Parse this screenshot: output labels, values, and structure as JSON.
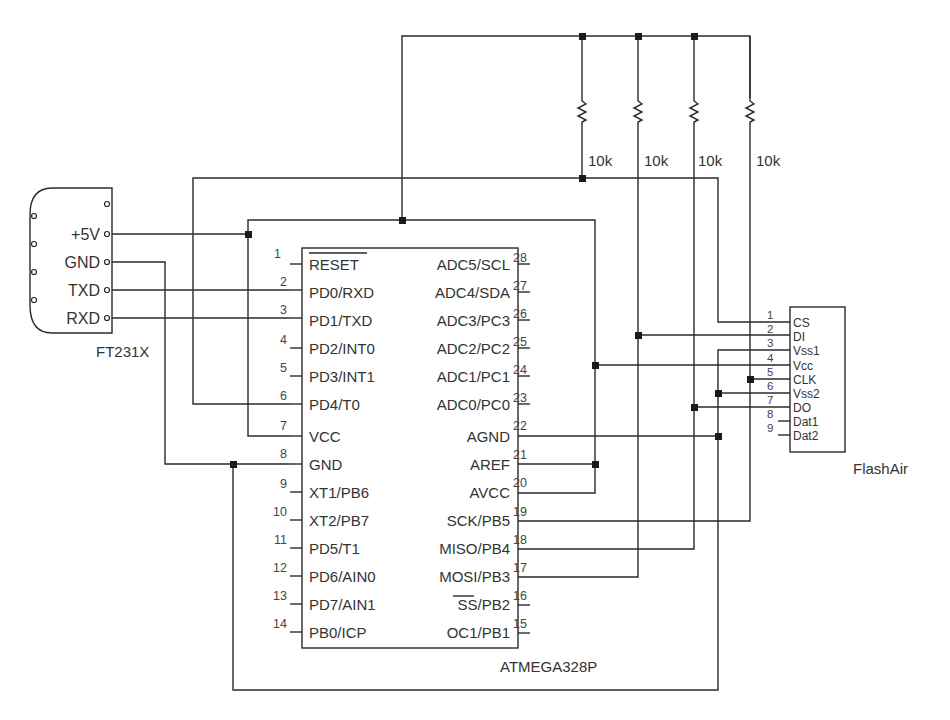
{
  "diagram": {
    "type": "circuit-schematic",
    "resistors": [
      {
        "value": "10k"
      },
      {
        "value": "10k"
      },
      {
        "value": "10k"
      },
      {
        "value": "10k"
      }
    ],
    "ft231x": {
      "name": "FT231X",
      "pins": [
        "+5V",
        "GND",
        "TXD",
        "RXD"
      ]
    },
    "atmega": {
      "name": "ATMEGA328P",
      "left_pins": [
        {
          "num": "1",
          "label": "RESET",
          "overline": true
        },
        {
          "num": "2",
          "label": "PD0/RXD"
        },
        {
          "num": "3",
          "label": "PD1/TXD"
        },
        {
          "num": "4",
          "label": "PD2/INT0"
        },
        {
          "num": "5",
          "label": "PD3/INT1"
        },
        {
          "num": "6",
          "label": "PD4/T0"
        },
        {
          "num": "7",
          "label": "VCC"
        },
        {
          "num": "8",
          "label": "GND"
        },
        {
          "num": "9",
          "label": "XT1/PB6"
        },
        {
          "num": "10",
          "label": "XT2/PB7"
        },
        {
          "num": "11",
          "label": "PD5/T1"
        },
        {
          "num": "12",
          "label": "PD6/AIN0"
        },
        {
          "num": "13",
          "label": "PD7/AIN1"
        },
        {
          "num": "14",
          "label": "PB0/ICP"
        }
      ],
      "right_pins": [
        {
          "num": "28",
          "label": "ADC5/SCL"
        },
        {
          "num": "27",
          "label": "ADC4/SDA"
        },
        {
          "num": "26",
          "label": "ADC3/PC3"
        },
        {
          "num": "25",
          "label": "ADC2/PC2"
        },
        {
          "num": "24",
          "label": "ADC1/PC1"
        },
        {
          "num": "23",
          "label": "ADC0/PC0"
        },
        {
          "num": "22",
          "label": "AGND"
        },
        {
          "num": "21",
          "label": "AREF"
        },
        {
          "num": "20",
          "label": "AVCC"
        },
        {
          "num": "19",
          "label": "SCK/PB5"
        },
        {
          "num": "18",
          "label": "MISO/PB4"
        },
        {
          "num": "17",
          "label": "MOSI/PB3"
        },
        {
          "num": "16",
          "label": "SS/PB2",
          "overline_part": "SS"
        },
        {
          "num": "15",
          "label": "OC1/PB1"
        }
      ]
    },
    "flashair": {
      "name": "FlashAir",
      "pins": [
        {
          "num": "1",
          "label": "CS"
        },
        {
          "num": "2",
          "label": "DI"
        },
        {
          "num": "3",
          "label": "Vss1"
        },
        {
          "num": "4",
          "label": "Vcc"
        },
        {
          "num": "5",
          "label": "CLK"
        },
        {
          "num": "6",
          "label": "Vss2"
        },
        {
          "num": "7",
          "label": "DO"
        },
        {
          "num": "8",
          "label": "Dat1"
        },
        {
          "num": "9",
          "label": "Dat2"
        }
      ]
    }
  },
  "colors": {
    "line": "#2a2a2a",
    "text": "#333333",
    "background": "#ffffff"
  }
}
